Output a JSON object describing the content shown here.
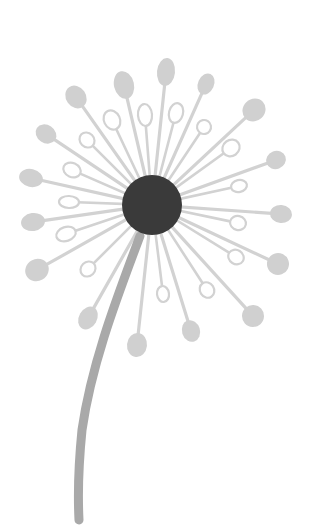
{
  "illustration": {
    "title": "Dandelion",
    "colors": {
      "background": "#ffffff",
      "center": "#3a3a3a",
      "stem": "#a9a9a9",
      "spokes": "#d2d2d2",
      "seed_filled": "#d0d0d0",
      "seed_outline": "#d2d2d2"
    },
    "center": {
      "cx": 152,
      "cy": 205,
      "r": 30
    },
    "stem": {
      "path": "M140 236 C 120 290, 92 360, 82 430 C 78 470, 78 500, 79 520",
      "width": 9
    },
    "filled_seeds": [
      {
        "x": 76,
        "y": 97,
        "rx": 10,
        "ry": 12
      },
      {
        "x": 124,
        "y": 85,
        "rx": 10,
        "ry": 14
      },
      {
        "x": 166,
        "y": 72,
        "rx": 9,
        "ry": 14
      },
      {
        "x": 206,
        "y": 84,
        "rx": 8,
        "ry": 11
      },
      {
        "x": 254,
        "y": 110,
        "rx": 12,
        "ry": 11
      },
      {
        "x": 276,
        "y": 160,
        "rx": 10,
        "ry": 9
      },
      {
        "x": 281,
        "y": 214,
        "rx": 11,
        "ry": 9
      },
      {
        "x": 278,
        "y": 264,
        "rx": 11,
        "ry": 11
      },
      {
        "x": 253,
        "y": 316,
        "rx": 11,
        "ry": 11
      },
      {
        "x": 191,
        "y": 331,
        "rx": 9,
        "ry": 11
      },
      {
        "x": 137,
        "y": 345,
        "rx": 10,
        "ry": 12
      },
      {
        "x": 88,
        "y": 318,
        "rx": 9,
        "ry": 12
      },
      {
        "x": 37,
        "y": 270,
        "rx": 12,
        "ry": 11
      },
      {
        "x": 33,
        "y": 222,
        "rx": 12,
        "ry": 9
      },
      {
        "x": 31,
        "y": 178,
        "rx": 12,
        "ry": 9
      },
      {
        "x": 46,
        "y": 134,
        "rx": 11,
        "ry": 9
      }
    ],
    "hollow_seeds": [
      {
        "x": 112,
        "y": 120,
        "rx": 8,
        "ry": 10
      },
      {
        "x": 145,
        "y": 115,
        "rx": 7,
        "ry": 11
      },
      {
        "x": 176,
        "y": 113,
        "rx": 7,
        "ry": 10
      },
      {
        "x": 204,
        "y": 127,
        "rx": 7,
        "ry": 7
      },
      {
        "x": 231,
        "y": 148,
        "rx": 9,
        "ry": 8
      },
      {
        "x": 239,
        "y": 186,
        "rx": 8,
        "ry": 6
      },
      {
        "x": 238,
        "y": 223,
        "rx": 8,
        "ry": 7
      },
      {
        "x": 236,
        "y": 257,
        "rx": 8,
        "ry": 7
      },
      {
        "x": 207,
        "y": 290,
        "rx": 7,
        "ry": 8
      },
      {
        "x": 163,
        "y": 294,
        "rx": 6,
        "ry": 8
      },
      {
        "x": 88,
        "y": 269,
        "rx": 7,
        "ry": 8
      },
      {
        "x": 66,
        "y": 234,
        "rx": 10,
        "ry": 7
      },
      {
        "x": 69,
        "y": 202,
        "rx": 10,
        "ry": 6
      },
      {
        "x": 72,
        "y": 170,
        "rx": 9,
        "ry": 7
      },
      {
        "x": 87,
        "y": 140,
        "rx": 8,
        "ry": 7
      }
    ]
  }
}
